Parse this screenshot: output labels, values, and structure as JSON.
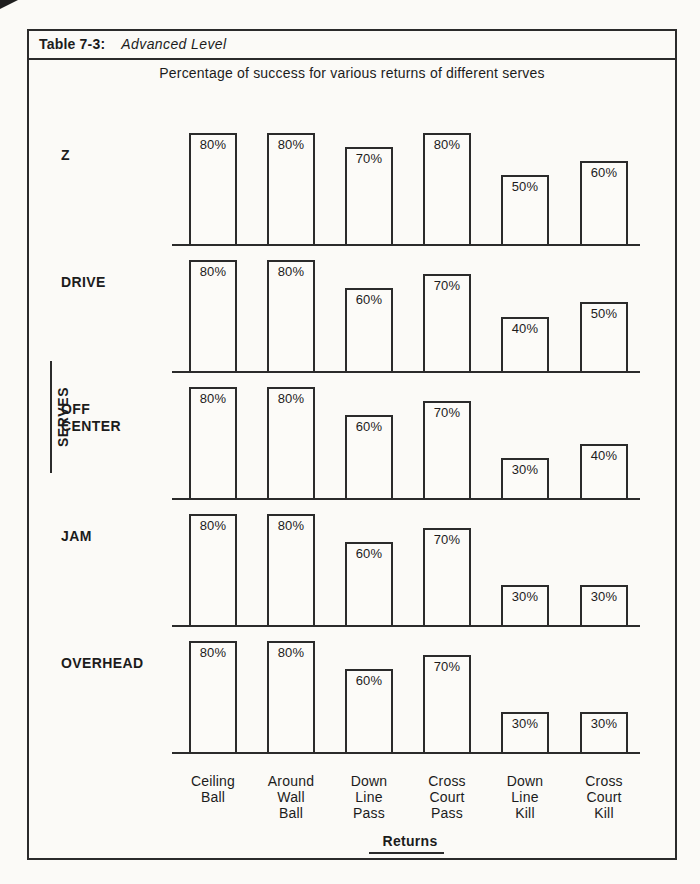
{
  "header": {
    "table_label": "Table 7-3:",
    "table_title": "Advanced Level"
  },
  "colors": {
    "line": "#2b2b2b",
    "paper": "#fbfaf7",
    "bar_fill": "#fcfbf8",
    "text": "#1c1c1c"
  },
  "chart_data": {
    "type": "bar",
    "title": "Percentage of success for various returns of different serves",
    "xlabel": "Returns",
    "ylabel": "SERVES",
    "ylim": [
      0,
      100
    ],
    "value_suffix": "%",
    "grid": false,
    "legend": "none",
    "layout": "small-multiples: one bar row per serve, values labeled inside bar tops",
    "categories": [
      "Ceiling Ball",
      "Around Wall Ball",
      "Down Line Pass",
      "Cross Court Pass",
      "Down Line Kill",
      "Cross Court Kill"
    ],
    "category_lines": [
      [
        "Ceiling",
        "Ball"
      ],
      [
        "Around",
        "Wall",
        "Ball"
      ],
      [
        "Down",
        "Line",
        "Pass"
      ],
      [
        "Cross",
        "Court",
        "Pass"
      ],
      [
        "Down",
        "Line",
        "Kill"
      ],
      [
        "Cross",
        "Court",
        "Kill"
      ]
    ],
    "series": [
      {
        "name": "Z",
        "name_lines": [
          "Z"
        ],
        "values": [
          80,
          80,
          70,
          80,
          50,
          60
        ]
      },
      {
        "name": "DRIVE",
        "name_lines": [
          "DRIVE"
        ],
        "values": [
          80,
          80,
          60,
          70,
          40,
          50
        ]
      },
      {
        "name": "OFF CENTER",
        "name_lines": [
          "OFF",
          "CENTER"
        ],
        "values": [
          80,
          80,
          60,
          70,
          30,
          40
        ]
      },
      {
        "name": "JAM",
        "name_lines": [
          "JAM"
        ],
        "values": [
          80,
          80,
          60,
          70,
          30,
          30
        ]
      },
      {
        "name": "OVERHEAD",
        "name_lines": [
          "OVERHEAD"
        ],
        "values": [
          80,
          80,
          60,
          70,
          30,
          30
        ]
      }
    ]
  }
}
